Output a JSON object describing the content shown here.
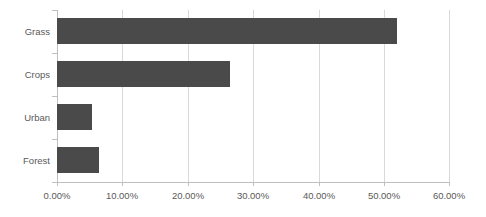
{
  "chart_data": {
    "type": "bar",
    "orientation": "horizontal",
    "title": "",
    "subtitle": "",
    "xlabel": "",
    "ylabel": "",
    "categories": [
      "Grass",
      "Crops",
      "Urban",
      "Forest"
    ],
    "values": [
      51.9,
      26.4,
      5.3,
      6.4
    ],
    "value_labels": [
      "51.90%",
      "26.40%",
      "5.30%",
      "6.40%"
    ],
    "series": [
      {
        "name": "",
        "values": [
          51.9,
          26.4,
          5.3,
          6.4
        ]
      }
    ],
    "xlim": [
      0,
      60
    ],
    "x_ticks": [
      0,
      10,
      20,
      30,
      40,
      50,
      60
    ],
    "x_tick_labels": [
      "0.00%",
      "10.00%",
      "20.00%",
      "30.00%",
      "40.00%",
      "50.00%",
      "60.00%"
    ],
    "x_tick_format": "percent",
    "grid": "vertical",
    "legend": "none",
    "legend_position": "",
    "annotations": [],
    "colors": {
      "bar": "#4a4a4a",
      "gridline": "#d9d9d9",
      "axis": "#bfbfbf",
      "text": "#595959",
      "background": "#ffffff"
    }
  }
}
